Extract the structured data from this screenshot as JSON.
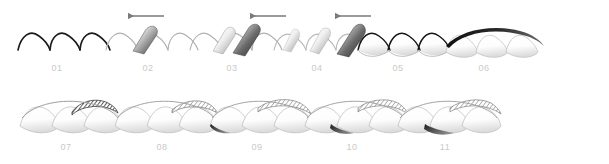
{
  "figure": {
    "title": "",
    "background_color": "#ffffff",
    "rows": 2,
    "panel_count": 11,
    "label_color": "#c9c9c9",
    "outline_color": "#111111",
    "light_outline_color": "#b5b5b5",
    "arrow_color": "#7a7a7a",
    "gradient_light": "#ffffff",
    "gradient_dark": "#3a3a3a",
    "hatch_color": "#2b2b2b"
  },
  "panels": [
    {
      "id": "01",
      "label": "01",
      "row": 1,
      "x": 18,
      "y": 22,
      "label_x": 37,
      "label_y": 63,
      "arrow": false,
      "arcs": 3,
      "arc_style": "open-outline",
      "flaps": 0,
      "flap_fill": "none",
      "description": "three open arcs, dark thin outline, no fill"
    },
    {
      "id": "02",
      "label": "02",
      "row": 1,
      "x": 106,
      "y": 22,
      "label_x": 108,
      "label_y": 63,
      "arrow": true,
      "arrow_x": 124,
      "arrow_y": 16,
      "arrow_direction": "left",
      "arcs": 3,
      "arc_style": "light-outline",
      "flaps": 1,
      "flap_fill": "gradient",
      "description": "one lifted gradient flap on first arc, leftward arrow above"
    },
    {
      "id": "03",
      "label": "03",
      "row": 1,
      "x": 190,
      "y": 22,
      "label_x": 192,
      "label_y": 63,
      "arrow": true,
      "arrow_x": 250,
      "arrow_y": 16,
      "arrow_direction": "left",
      "arcs": 3,
      "arc_style": "light-outline",
      "flaps": 2,
      "flap_fill": "gradient",
      "description": "two lifted gradient flaps, leftward arrow above"
    },
    {
      "id": "04",
      "label": "04",
      "row": 1,
      "x": 274,
      "y": 22,
      "label_x": 277,
      "label_y": 63,
      "arrow": true,
      "arrow_x": 335,
      "arrow_y": 16,
      "arrow_direction": "left",
      "arcs": 3,
      "arc_style": "light-outline",
      "flaps": 3,
      "flap_fill": "gradient",
      "description": "three lifted gradient flaps, rightmost darkest, leftward arrow above"
    },
    {
      "id": "05",
      "label": "05",
      "row": 1,
      "x": 358,
      "y": 22,
      "label_x": 358,
      "label_y": 63,
      "arrow": false,
      "arcs": 3,
      "arc_style": "dark-outline",
      "flaps": 0,
      "flap_fill": "shell-gradient",
      "description": "three closed shells filled with vertical gradient, dark top outline"
    },
    {
      "id": "06",
      "label": "06",
      "row": 1,
      "x": 446,
      "y": 22,
      "label_x": 444,
      "label_y": 63,
      "arrow": false,
      "arcs": 3,
      "arc_style": "swept",
      "flaps": 0,
      "flap_fill": "shell-gradient",
      "overlay": "dark-sweep-curve",
      "description": "three shells with a dark tapered sweeping curve arcing over the top"
    },
    {
      "id": "07",
      "label": "07",
      "row": 2,
      "x": 20,
      "y": 96,
      "label_x": 46,
      "label_y": 143,
      "arrow": false,
      "arcs": 3,
      "arc_style": "swept",
      "flaps": 0,
      "flap_fill": "shell-gradient",
      "overlay": "hatched-cap",
      "hatch_position": "right",
      "description": "three shells, dark diagonal-hatched cap over the right shell"
    },
    {
      "id": "08",
      "label": "08",
      "row": 2,
      "x": 115,
      "y": 96,
      "label_x": 142,
      "label_y": 143,
      "arrow": false,
      "arcs": 3,
      "arc_style": "swept",
      "flaps": 0,
      "flap_fill": "shell-gradient",
      "overlay": "hatched-cap",
      "hatch_position": "center-right",
      "description": "three shells, lighter hatched cap shifted toward the centre-right"
    },
    {
      "id": "09",
      "label": "09",
      "row": 2,
      "x": 210,
      "y": 96,
      "label_x": 237,
      "label_y": 143,
      "arrow": false,
      "arcs": 3,
      "arc_style": "swept",
      "flaps": 0,
      "flap_fill": "shell-gradient",
      "overlay": "hatched-cap",
      "hatch_position": "center",
      "extra": "dark-wedge-left",
      "description": "three shells, hatched cap over centre shell plus dark wedge at lower left"
    },
    {
      "id": "10",
      "label": "10",
      "row": 2,
      "x": 305,
      "y": 96,
      "label_x": 332,
      "label_y": 143,
      "arrow": false,
      "arcs": 3,
      "arc_style": "swept",
      "flaps": 0,
      "flap_fill": "shell-gradient",
      "overlay": "hatched-cap",
      "hatch_position": "center-right",
      "extra": "dark-wedge-center",
      "description": "three shells, hatched cap plus dark wedge beneath the centre shell"
    },
    {
      "id": "11",
      "label": "11",
      "row": 2,
      "x": 398,
      "y": 96,
      "label_x": 425,
      "label_y": 143,
      "arrow": false,
      "arcs": 3,
      "arc_style": "swept",
      "flaps": 0,
      "flap_fill": "shell-gradient",
      "overlay": "hatched-cap",
      "hatch_position": "right",
      "extra": "dark-wedge-right",
      "description": "three shells, hatched cap plus dark wedge beneath the right shell"
    }
  ]
}
